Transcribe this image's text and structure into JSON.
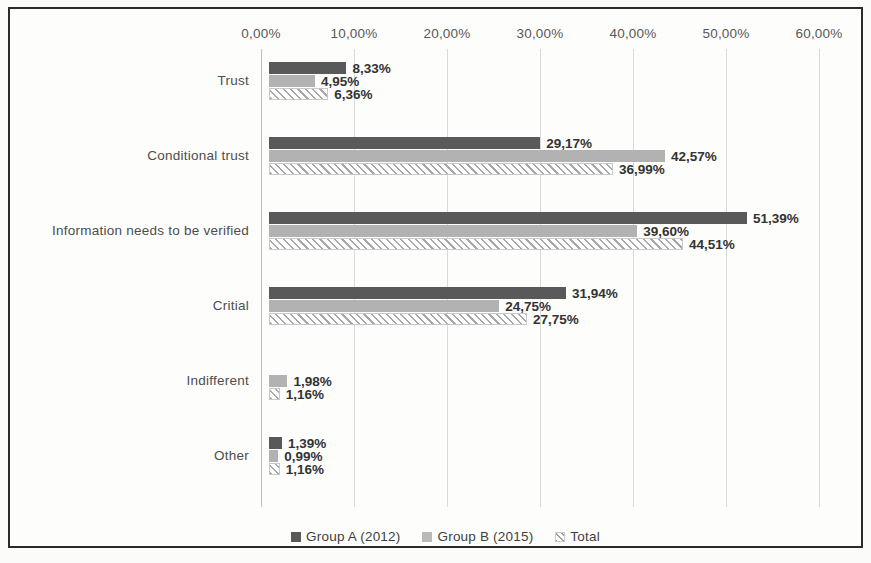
{
  "chart_data": {
    "type": "bar",
    "orientation": "horizontal",
    "title": "",
    "xlabel": "",
    "ylabel": "",
    "xlim": [
      0,
      60
    ],
    "grid": true,
    "legend_position": "bottom",
    "x_ticks": [
      "0,00%",
      "10,00%",
      "20,00%",
      "30,00%",
      "40,00%",
      "50,00%",
      "60,00%"
    ],
    "x_tick_values": [
      0,
      10,
      20,
      30,
      40,
      50,
      60
    ],
    "categories": [
      "Trust",
      "Conditional trust",
      "Information needs to be verified",
      "Critial",
      "Indifferent",
      "Other"
    ],
    "series": [
      {
        "name": "Group A (2012)",
        "color": "#595959",
        "pattern": "solid",
        "values": [
          8.33,
          29.17,
          51.39,
          31.94,
          0,
          1.39
        ],
        "labels": [
          "8,33%",
          "29,17%",
          "51,39%",
          "31,94%",
          "",
          "1,39%"
        ]
      },
      {
        "name": "Group B (2015)",
        "color": "#b2b2b2",
        "pattern": "solid",
        "values": [
          4.95,
          42.57,
          39.6,
          24.75,
          1.98,
          0.99
        ],
        "labels": [
          "4,95%",
          "42,57%",
          "39,60%",
          "24,75%",
          "1,98%",
          "0,99%"
        ]
      },
      {
        "name": "Total",
        "color": "#ffffff",
        "pattern": "diagonal-hatch",
        "values": [
          6.36,
          36.99,
          44.51,
          27.75,
          1.16,
          1.16
        ],
        "labels": [
          "6,36%",
          "36,99%",
          "44,51%",
          "27,75%",
          "1,16%",
          "1,16%"
        ]
      }
    ]
  },
  "legend": {
    "items": [
      {
        "label": "Group A (2012)",
        "swatch": "serie-a"
      },
      {
        "label": "Group B (2015)",
        "swatch": "serie-b"
      },
      {
        "label": "Total",
        "swatch": "serie-total"
      }
    ]
  }
}
